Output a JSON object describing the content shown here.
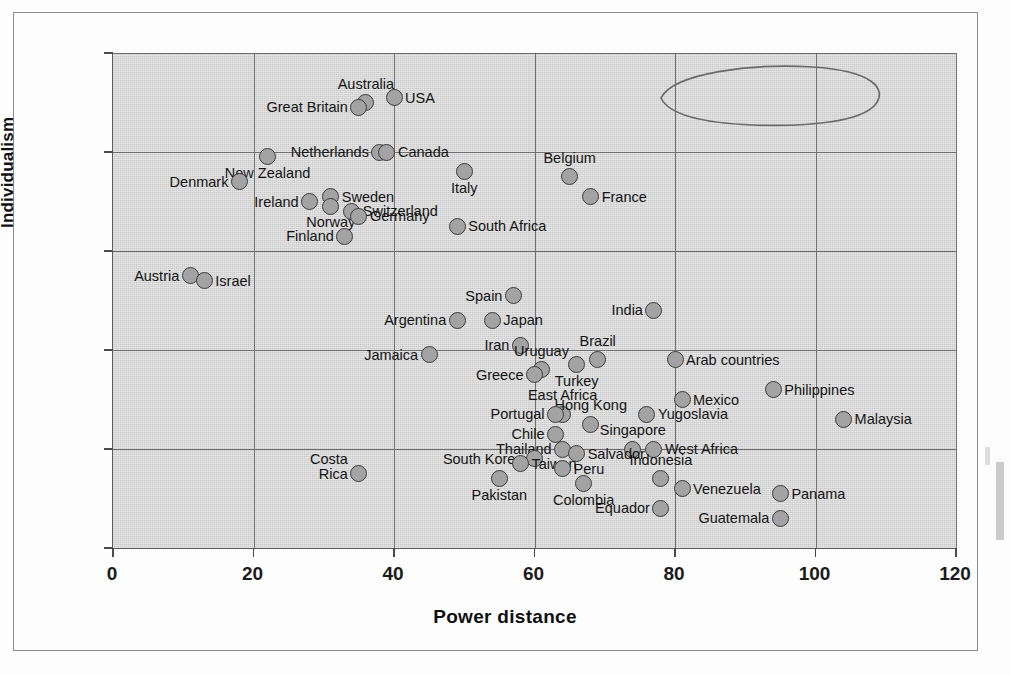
{
  "chart_data": {
    "type": "scatter",
    "title": "",
    "xlabel": "Power distance",
    "ylabel": "Individualism",
    "xlim": [
      0,
      120
    ],
    "ylim": [
      0,
      100
    ],
    "xticks": [
      0,
      20,
      40,
      60,
      80,
      100,
      120
    ],
    "yticks": [
      0,
      20,
      40,
      60,
      80,
      100
    ],
    "grid": true,
    "legend": "none",
    "plot_background": "#c9c9c9",
    "marker_fill": "#a3a3a3",
    "marker_edge": "#3b3b3b",
    "annotations": [
      {
        "name": "arab-countries-circle",
        "shape": "hand-drawn-ellipse",
        "encloses": "Arab countries"
      }
    ],
    "points": [
      {
        "label": "Australia",
        "x": 36,
        "y": 90,
        "pos": "above"
      },
      {
        "label": "Great Britain",
        "x": 35,
        "y": 89,
        "pos": "left"
      },
      {
        "label": "USA",
        "x": 40,
        "y": 91,
        "pos": "right"
      },
      {
        "label": "Netherlands",
        "x": 38,
        "y": 80,
        "pos": "left"
      },
      {
        "label": "Canada",
        "x": 39,
        "y": 80,
        "pos": "right"
      },
      {
        "label": "New Zealand",
        "x": 22,
        "y": 79,
        "pos": "below"
      },
      {
        "label": "Denmark",
        "x": 18,
        "y": 74,
        "pos": "left"
      },
      {
        "label": "Ireland",
        "x": 28,
        "y": 70,
        "pos": "left"
      },
      {
        "label": "Sweden",
        "x": 31,
        "y": 71,
        "pos": "right"
      },
      {
        "label": "Norway",
        "x": 31,
        "y": 69,
        "pos": "below"
      },
      {
        "label": "Switzerland",
        "x": 34,
        "y": 68,
        "pos": "right"
      },
      {
        "label": "Germany",
        "x": 35,
        "y": 67,
        "pos": "right"
      },
      {
        "label": "Finland",
        "x": 33,
        "y": 63,
        "pos": "left"
      },
      {
        "label": "Italy",
        "x": 50,
        "y": 76,
        "pos": "below"
      },
      {
        "label": "Belgium",
        "x": 65,
        "y": 75,
        "pos": "above"
      },
      {
        "label": "France",
        "x": 68,
        "y": 71,
        "pos": "right"
      },
      {
        "label": "South Africa",
        "x": 49,
        "y": 65,
        "pos": "right"
      },
      {
        "label": "Austria",
        "x": 11,
        "y": 55,
        "pos": "left"
      },
      {
        "label": "Israel",
        "x": 13,
        "y": 54,
        "pos": "right"
      },
      {
        "label": "Spain",
        "x": 57,
        "y": 51,
        "pos": "left"
      },
      {
        "label": "India",
        "x": 77,
        "y": 48,
        "pos": "left"
      },
      {
        "label": "Argentina",
        "x": 49,
        "y": 46,
        "pos": "left"
      },
      {
        "label": "Japan",
        "x": 54,
        "y": 46,
        "pos": "right"
      },
      {
        "label": "Iran",
        "x": 58,
        "y": 41,
        "pos": "left"
      },
      {
        "label": "Brazil",
        "x": 69,
        "y": 38,
        "pos": "above"
      },
      {
        "label": "Jamaica",
        "x": 45,
        "y": 39,
        "pos": "left"
      },
      {
        "label": "Uruguay",
        "x": 61,
        "y": 36,
        "pos": "above"
      },
      {
        "label": "Turkey",
        "x": 66,
        "y": 37,
        "pos": "below"
      },
      {
        "label": "Greece",
        "x": 60,
        "y": 35,
        "pos": "left"
      },
      {
        "label": "Arab countries",
        "x": 80,
        "y": 38,
        "pos": "right"
      },
      {
        "label": "Philippines",
        "x": 94,
        "y": 32,
        "pos": "right"
      },
      {
        "label": "Mexico",
        "x": 81,
        "y": 30,
        "pos": "right"
      },
      {
        "label": "East Africa",
        "x": 64,
        "y": 27,
        "pos": "above"
      },
      {
        "label": "Hong Kong",
        "x": 68,
        "y": 25,
        "pos": "above"
      },
      {
        "label": "Yugoslavia",
        "x": 76,
        "y": 27,
        "pos": "right"
      },
      {
        "label": "Malaysia",
        "x": 104,
        "y": 26,
        "pos": "right"
      },
      {
        "label": "Portugal",
        "x": 63,
        "y": 27,
        "pos": "left"
      },
      {
        "label": "Chile",
        "x": 63,
        "y": 23,
        "pos": "left"
      },
      {
        "label": "Singapore",
        "x": 74,
        "y": 20,
        "pos": "above"
      },
      {
        "label": "Thailand",
        "x": 64,
        "y": 20,
        "pos": "left"
      },
      {
        "label": "West Africa",
        "x": 77,
        "y": 20,
        "pos": "right"
      },
      {
        "label": "Salvador",
        "x": 66,
        "y": 19,
        "pos": "right"
      },
      {
        "label": "South Korea",
        "x": 60,
        "y": 18,
        "pos": "left"
      },
      {
        "label": "Taiwan",
        "x": 58,
        "y": 17,
        "pos": "right"
      },
      {
        "label": "Peru",
        "x": 64,
        "y": 16,
        "pos": "right"
      },
      {
        "label": "Costa Rica",
        "x": 35,
        "y": 15,
        "pos": "left"
      },
      {
        "label": "Pakistan",
        "x": 55,
        "y": 14,
        "pos": "below"
      },
      {
        "label": "Colombia",
        "x": 67,
        "y": 13,
        "pos": "below"
      },
      {
        "label": "Indonesia",
        "x": 78,
        "y": 14,
        "pos": "above"
      },
      {
        "label": "Venezuela",
        "x": 81,
        "y": 12,
        "pos": "right"
      },
      {
        "label": "Panama",
        "x": 95,
        "y": 11,
        "pos": "right"
      },
      {
        "label": "Equador",
        "x": 78,
        "y": 8,
        "pos": "left"
      },
      {
        "label": "Guatemala",
        "x": 95,
        "y": 6,
        "pos": "left"
      }
    ]
  }
}
